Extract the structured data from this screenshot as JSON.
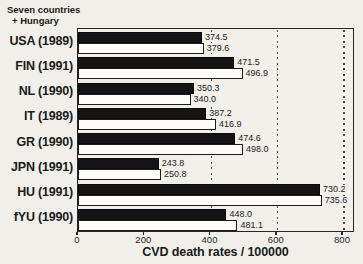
{
  "header": {
    "title_line1": "Seven countries",
    "title_line2": "+ Hungary"
  },
  "chart_data": {
    "type": "bar",
    "orientation": "horizontal",
    "title": "Seven countries + Hungary",
    "xlabel": "CVD death rates / 100000",
    "categories": [
      "USA (1989)",
      "FIN (1991)",
      "NL (1990)",
      "IT (1989)",
      "GR (1990)",
      "JPN (1991)",
      "HU (1991)",
      "fYU (1990)"
    ],
    "series": [
      {
        "name": "black bars",
        "color": "#141414",
        "values": [
          374.5,
          471.5,
          350.3,
          387.2,
          474.6,
          243.8,
          730.2,
          448.0
        ],
        "labels": [
          "374.5",
          "471.5",
          "350.3",
          "387.2",
          "474.6",
          "243.8",
          "730.2",
          "448.0"
        ]
      },
      {
        "name": "white bars",
        "color": "#fdfcf8",
        "values": [
          379.6,
          496.9,
          340.0,
          416.9,
          498.0,
          250.8,
          735.6,
          481.1
        ],
        "labels": [
          "379.6",
          "496.9",
          "340.0",
          "416.9",
          "498.0",
          "250.8",
          "735.6",
          "481.1"
        ]
      }
    ],
    "x_ticks": [
      0,
      200,
      400,
      600,
      800
    ],
    "xlim": [
      0,
      830
    ],
    "gridlines_at": [
      400,
      600,
      800
    ],
    "grid_style": "dotted vertical",
    "legend": "none"
  }
}
